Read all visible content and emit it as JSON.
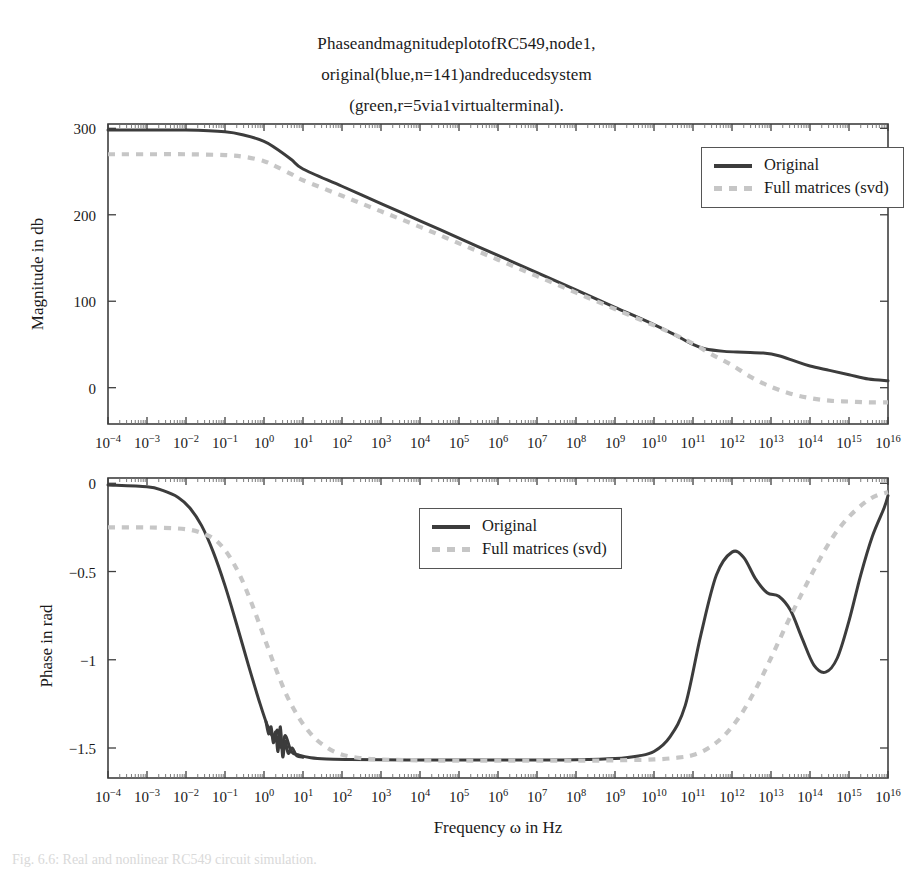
{
  "figure": {
    "title_lines": [
      "PhaseandmagnitudeplotofRC549,node1,",
      "original(blue,n=141)andreducedsystem",
      "(green,r=5via1virtualterminal)."
    ],
    "caption": "Fig. 6.6: Real and nonlinear RC549 circuit simulation."
  },
  "colors": {
    "original": "#3c3c3c",
    "reduced": "#c6c6c6",
    "axis": "#3f3f3f",
    "background": "#ffffff"
  },
  "legend": {
    "position": "inside-upper-right",
    "entries": [
      {
        "label": "Original",
        "style": "solid",
        "color": "#3c3c3c"
      },
      {
        "label": "Full matrices (svd)",
        "style": "dashed",
        "color": "#c6c6c6"
      }
    ]
  },
  "xaxis": {
    "label": "Frequency ω in Hz",
    "scale": "log10",
    "min_exp": -4,
    "max_exp": 16,
    "tick_labels": [
      "10−4",
      "10−3",
      "10−2",
      "10−1",
      "10⁰",
      "10¹",
      "10²",
      "10³",
      "10⁴",
      "10⁵",
      "10⁶",
      "10⁷",
      "10⁸",
      "10⁹",
      "10¹⁰",
      "10¹¹",
      "10¹²",
      "10¹³",
      "10¹⁴",
      "10¹⁵",
      "10¹⁶"
    ],
    "tick_exponents": [
      -4,
      -3,
      -2,
      -1,
      0,
      1,
      2,
      3,
      4,
      5,
      6,
      7,
      8,
      9,
      10,
      11,
      12,
      13,
      14,
      15,
      16
    ],
    "minor_ticks": true
  },
  "chart_data": [
    {
      "type": "line",
      "id": "magnitude-plot",
      "title": "Magnitude",
      "xlabel": "",
      "ylabel": "Magnitude in db",
      "xscale": "log10",
      "xlim": [
        -4,
        16
      ],
      "ylim": [
        -42,
        305
      ],
      "yticks": [
        0,
        100,
        200,
        300
      ],
      "ytick_labels": [
        "0",
        "100",
        "200",
        "300"
      ],
      "grid": false,
      "legend_position": "upper right",
      "series": [
        {
          "name": "Original",
          "style": "solid",
          "color": "#3c3c3c",
          "x_exp": [
            -4,
            -3,
            -2,
            -1,
            -0.5,
            0,
            0.3,
            0.7,
            1,
            2,
            3,
            4,
            5,
            6,
            7,
            8,
            9,
            10,
            10.5,
            11,
            11.3,
            11.8,
            12.3,
            12.8,
            13.2,
            13.6,
            14,
            14.5,
            15,
            15.5,
            16
          ],
          "y": [
            298,
            298,
            298,
            296,
            292,
            285,
            277,
            264,
            253,
            233,
            213,
            193,
            173,
            153,
            133,
            113,
            93,
            73,
            62,
            50,
            45,
            42,
            41,
            40,
            37,
            31,
            25,
            20,
            15,
            10,
            8
          ]
        },
        {
          "name": "Full matrices (svd)",
          "style": "dashed",
          "color": "#c6c6c6",
          "x_exp": [
            -4,
            -3,
            -2,
            -1,
            -0.5,
            0,
            0.3,
            0.7,
            1,
            2,
            3,
            4,
            5,
            6,
            7,
            8,
            9,
            10,
            10.5,
            11,
            11.5,
            12,
            12.5,
            13,
            13.5,
            14,
            14.5,
            15,
            15.5,
            16
          ],
          "y": [
            270,
            270,
            270,
            269,
            267,
            262,
            256,
            247,
            240,
            222,
            204,
            186,
            167,
            148,
            129,
            110,
            91,
            72,
            62,
            51,
            38,
            26,
            12,
            1,
            -7,
            -12,
            -15,
            -16,
            -17,
            -17
          ]
        }
      ]
    },
    {
      "type": "line",
      "id": "phase-plot",
      "title": "Phase",
      "xlabel": "Frequency ω in Hz",
      "ylabel": "Phase in rad",
      "xscale": "log10",
      "xlim": [
        -4,
        16
      ],
      "ylim": [
        -1.67,
        0.03
      ],
      "yticks": [
        0,
        -0.5,
        -1,
        -1.5
      ],
      "ytick_labels": [
        "0",
        "−0.5",
        "−1",
        "−1.5"
      ],
      "grid": false,
      "legend_position": "upper center",
      "series": [
        {
          "name": "Original",
          "style": "solid",
          "color": "#3c3c3c",
          "x_exp": [
            -4,
            -3,
            -2.6,
            -2.2,
            -1.9,
            -1.6,
            -1.3,
            -1.0,
            -0.7,
            -0.4,
            -0.1,
            0.1,
            0.25,
            0.35,
            0.45,
            0.55,
            0.7,
            0.9,
            1.2,
            1.6,
            2.2,
            3,
            4,
            5,
            6,
            7,
            8,
            9,
            9.6,
            10,
            10.4,
            10.8,
            11.2,
            11.6,
            12,
            12.3,
            12.6,
            12.9,
            13.2,
            13.5,
            13.8,
            14.1,
            14.4,
            14.7,
            15,
            15.3,
            15.6,
            15.9,
            16
          ],
          "y": [
            -0.01,
            -0.02,
            -0.04,
            -0.08,
            -0.14,
            -0.24,
            -0.39,
            -0.58,
            -0.8,
            -1.03,
            -1.25,
            -1.38,
            -1.44,
            -1.4,
            -1.5,
            -1.43,
            -1.52,
            -1.54,
            -1.555,
            -1.562,
            -1.565,
            -1.567,
            -1.568,
            -1.568,
            -1.568,
            -1.568,
            -1.567,
            -1.56,
            -1.545,
            -1.52,
            -1.44,
            -1.26,
            -0.86,
            -0.52,
            -0.39,
            -0.42,
            -0.54,
            -0.62,
            -0.64,
            -0.72,
            -0.88,
            -1.03,
            -1.07,
            -0.99,
            -0.78,
            -0.52,
            -0.3,
            -0.14,
            -0.07
          ]
        },
        {
          "name": "Full matrices (svd)",
          "style": "dashed",
          "color": "#c6c6c6",
          "x_exp": [
            -4,
            -3,
            -2,
            -1.5,
            -1.2,
            -0.9,
            -0.6,
            -0.3,
            0,
            0.3,
            0.6,
            0.9,
            1.2,
            1.5,
            1.9,
            2.4,
            3,
            4,
            5,
            6,
            7,
            8,
            9,
            10,
            10.6,
            11,
            11.4,
            11.8,
            12.2,
            12.6,
            13,
            13.4,
            13.8,
            14.2,
            14.6,
            15,
            15.4,
            15.7,
            16
          ],
          "y": [
            -0.25,
            -0.25,
            -0.26,
            -0.29,
            -0.33,
            -0.41,
            -0.53,
            -0.69,
            -0.87,
            -1.05,
            -1.21,
            -1.33,
            -1.42,
            -1.48,
            -1.53,
            -1.555,
            -1.565,
            -1.57,
            -1.572,
            -1.572,
            -1.572,
            -1.572,
            -1.57,
            -1.565,
            -1.555,
            -1.54,
            -1.5,
            -1.43,
            -1.32,
            -1.17,
            -0.99,
            -0.8,
            -0.62,
            -0.45,
            -0.3,
            -0.19,
            -0.11,
            -0.07,
            -0.05
          ]
        }
      ]
    }
  ]
}
